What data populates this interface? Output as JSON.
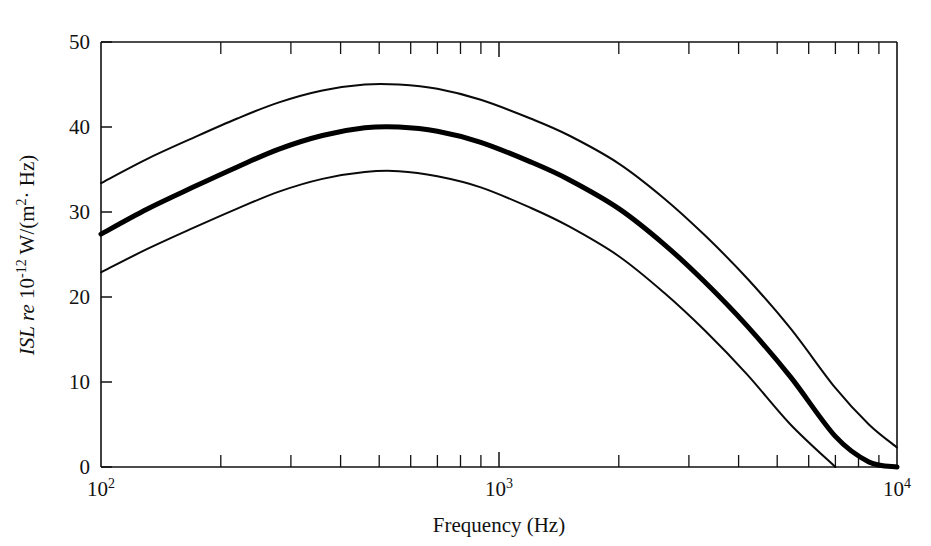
{
  "figure": {
    "background_color": "#ffffff",
    "ink_color": "#111111"
  },
  "axes": {
    "x": {
      "title": "Frequency (Hz)",
      "scale": "log",
      "range": [
        100,
        10000
      ],
      "tick_labels": [
        {
          "mantissa": "10",
          "exponent": "2",
          "value": 100
        },
        {
          "mantissa": "10",
          "exponent": "3",
          "value": 1000
        },
        {
          "mantissa": "10",
          "exponent": "4",
          "value": 10000
        }
      ],
      "minor_ticks": [
        200,
        300,
        400,
        500,
        600,
        700,
        800,
        900,
        2000,
        3000,
        4000,
        5000,
        6000,
        7000,
        8000,
        9000
      ]
    },
    "y": {
      "title_parts": {
        "italic_symbol": "ISL",
        "italic_re": "re",
        "mantissa": "10",
        "exponent": "-12",
        "units": "W/(m",
        "units_exponent": "2",
        "units_tail": "· Hz)"
      },
      "title_plain": "ISL re 10-12 W/(m2 · Hz)",
      "scale": "linear",
      "range": [
        0,
        50
      ],
      "tick_labels": [
        "0",
        "10",
        "20",
        "30",
        "40",
        "50"
      ],
      "tick_values": [
        0,
        10,
        20,
        30,
        40,
        50
      ]
    }
  },
  "chart_data": {
    "type": "line",
    "title": "",
    "xlabel": "Frequency (Hz)",
    "ylabel": "ISL re 10-12 W/(m2 · Hz)",
    "xscale": "log",
    "yscale": "linear",
    "xlim": [
      100,
      10000
    ],
    "ylim": [
      0,
      50
    ],
    "grid": false,
    "legend": "none",
    "x": [
      100,
      130,
      170,
      220,
      280,
      360,
      460,
      560,
      700,
      900,
      1200,
      1500,
      2000,
      2600,
      3300,
      4200,
      5400,
      7000,
      8500,
      10000
    ],
    "series": [
      {
        "name": "upper-bound",
        "style": "thin",
        "values": [
          33.4,
          36.2,
          38.7,
          41.0,
          42.9,
          44.3,
          45.0,
          45.0,
          44.5,
          43.2,
          41.0,
          39.0,
          35.7,
          31.6,
          27.2,
          22.2,
          16.3,
          9.3,
          5.0,
          2.3
        ]
      },
      {
        "name": "mean",
        "style": "thick",
        "values": [
          27.4,
          30.3,
          32.9,
          35.3,
          37.4,
          39.0,
          39.9,
          40.0,
          39.5,
          38.2,
          35.9,
          33.8,
          30.4,
          26.2,
          21.7,
          16.6,
          10.6,
          3.6,
          0.6,
          0.0
        ]
      },
      {
        "name": "lower-bound",
        "style": "thin",
        "values": [
          22.9,
          25.6,
          28.1,
          30.4,
          32.4,
          33.9,
          34.7,
          34.8,
          34.2,
          32.9,
          30.5,
          28.3,
          24.8,
          20.5,
          16.0,
          10.9,
          5.0,
          0.0,
          0.0,
          0.0
        ]
      }
    ]
  }
}
